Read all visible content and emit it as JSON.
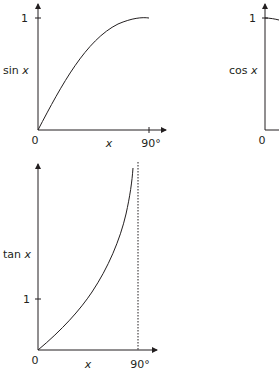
{
  "graphs": {
    "sin": {
      "ylabel_fn": "sin",
      "ylabel_var": "x",
      "y_tick": "1",
      "origin": "0",
      "xlabel": "x",
      "x_tick": "90°"
    },
    "cos": {
      "ylabel_fn": "cos",
      "ylabel_var": "x",
      "y_tick": "1",
      "origin": "0"
    },
    "tan": {
      "ylabel_fn": "tan",
      "ylabel_var": "x",
      "y_tick": "1",
      "origin": "0",
      "xlabel": "x",
      "x_tick": "90°"
    }
  },
  "colors": {
    "ink": "#231f20",
    "background": "#ffffff"
  }
}
